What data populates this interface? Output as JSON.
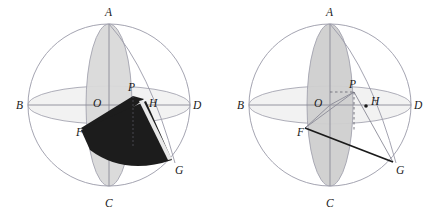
{
  "figure": {
    "panels": [
      {
        "id": "left",
        "name": "sphere-diagram-shaded",
        "labels": {
          "A": "A",
          "B": "B",
          "C": "C",
          "D": "D",
          "O": "O",
          "P": "P",
          "H": "H",
          "F": "F",
          "G": "G"
        }
      },
      {
        "id": "right",
        "name": "sphere-diagram-lines",
        "labels": {
          "A": "A",
          "B": "B",
          "C": "C",
          "D": "D",
          "O": "O",
          "P": "P",
          "H": "H",
          "F": "F",
          "G": "G"
        }
      }
    ],
    "colors": {
      "sphere_outline": "#9a9aa8",
      "equator_fill": "#f2f2f2",
      "equator_outline": "#9a9aa8",
      "meridian_fill_left": "#d9d9d9",
      "meridian_fill_right": "#cfcfcf",
      "meridian_outline": "#9a9aa8",
      "shaded_region": "#1c1c1c",
      "axis_line": "#8a8a96",
      "solid_line": "#1a1a1a",
      "dashed_line": "#55555f",
      "label_text": "#1a1a1a",
      "background": "#ffffff"
    },
    "geometry": {
      "center_x": 109,
      "center_y": 105,
      "radius": 81,
      "equator_ry": 19,
      "meridian_rx": 23
    }
  }
}
